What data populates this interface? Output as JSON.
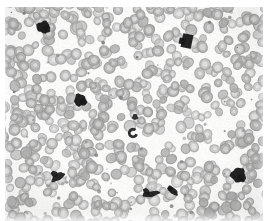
{
  "image": {
    "kind": "micrograph",
    "modality": "brightfield-light-microscopy",
    "specimen": "peripheral blood smear",
    "stain": "romanowsky-type (rendered grayscale)",
    "alt_text": "Grayscale light micrograph of a peripheral blood smear showing a dense monolayer of red blood cells with several darkly stained leukocyte nuclei",
    "width_px": 267,
    "height_px": 221,
    "margins_px": {
      "left": 5,
      "top": 7,
      "right": 4,
      "bottom": 0
    },
    "field_px": {
      "x": 5,
      "y": 7,
      "width": 258,
      "height": 214
    }
  },
  "palette": {
    "page_background": "#ffffff",
    "field_background": "#f2f1ef",
    "rbc_body": "#a9a7a4",
    "rbc_body_light": "#c6c4c1",
    "rbc_rim": "#8e8c89",
    "rbc_pallor": "#e9e8e6",
    "leukocyte_nucleus": "#1d1c1b",
    "platelet": "#6f6d6b",
    "debris": "#7a7877"
  },
  "rendering": {
    "rbc_count": 690,
    "rbc_radius_px": [
      4.2,
      6.4
    ],
    "platelet_count": 58,
    "noise_opacity": 0.1,
    "blur_px": 0.35,
    "seed": 20240517
  },
  "leukocytes": [
    {
      "id": "wbc-1",
      "label": "dark nucleus upper-left",
      "cx": 43,
      "cy": 27,
      "rx": 6.5,
      "ry": 6.0,
      "rot": -22,
      "shape": "lobed",
      "darkness": 0.97
    },
    {
      "id": "wbc-2",
      "label": "dark nucleus upper-right",
      "cx": 187,
      "cy": 41,
      "rx": 5.2,
      "ry": 7.0,
      "rot": 12,
      "shape": "blocky",
      "darkness": 0.95
    },
    {
      "id": "wbc-3",
      "label": "dark nucleus mid-left",
      "cx": 80,
      "cy": 100,
      "rx": 6.0,
      "ry": 6.2,
      "rot": 8,
      "shape": "lobed",
      "darkness": 0.96
    },
    {
      "id": "wbc-4",
      "label": "dark nucleus center",
      "cx": 133,
      "cy": 133,
      "rx": 5.0,
      "ry": 5.2,
      "rot": -5,
      "shape": "ring",
      "darkness": 0.9
    },
    {
      "id": "wbc-5",
      "label": "band nucleus lower-left",
      "cx": 58,
      "cy": 177,
      "rx": 7.5,
      "ry": 3.4,
      "rot": -32,
      "shape": "band",
      "darkness": 0.93
    },
    {
      "id": "wbc-6",
      "label": "elongated nucleus lower-center",
      "cx": 151,
      "cy": 194,
      "rx": 9.0,
      "ry": 2.8,
      "rot": -10,
      "shape": "elongated",
      "darkness": 0.92
    },
    {
      "id": "wbc-7",
      "label": "elongated nucleus lower-center-right",
      "cx": 173,
      "cy": 191,
      "rx": 6.0,
      "ry": 3.0,
      "rot": 38,
      "shape": "elongated",
      "darkness": 0.93
    },
    {
      "id": "wbc-8",
      "label": "dark nucleus lower-right",
      "cx": 238,
      "cy": 175,
      "rx": 7.0,
      "ry": 7.5,
      "rot": 18,
      "shape": "lobed",
      "darkness": 0.96
    },
    {
      "id": "wbc-9",
      "label": "small dark nucleus far-left",
      "cx": 135,
      "cy": 117,
      "rx": 3.0,
      "ry": 3.0,
      "rot": 0,
      "shape": "dot",
      "darkness": 0.85
    }
  ]
}
